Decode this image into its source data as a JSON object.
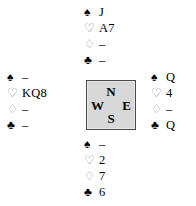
{
  "diagram": {
    "type": "bridge-hand-diagram",
    "suit_glyphs": {
      "spade": "♠",
      "heart": "♡",
      "diamond": "♢",
      "club": "♣"
    },
    "void_marker": "–",
    "compass": {
      "north": "N",
      "west": "W",
      "east": "E",
      "south": "S",
      "fill_color": "#d8d8d8",
      "border_color": "#4a4a4a"
    },
    "hands": {
      "north": {
        "label": "North",
        "rows": [
          {
            "suit": "spade",
            "cards": "J"
          },
          {
            "suit": "heart",
            "cards": "A7"
          },
          {
            "suit": "diamond",
            "cards": "–"
          },
          {
            "suit": "club",
            "cards": "–"
          }
        ]
      },
      "west": {
        "label": "West",
        "rows": [
          {
            "suit": "spade",
            "cards": "–"
          },
          {
            "suit": "heart",
            "cards": "KQ8"
          },
          {
            "suit": "diamond",
            "cards": "–"
          },
          {
            "suit": "club",
            "cards": "–"
          }
        ]
      },
      "east": {
        "label": "East",
        "rows": [
          {
            "suit": "spade",
            "cards": "Q"
          },
          {
            "suit": "heart",
            "cards": "4"
          },
          {
            "suit": "diamond",
            "cards": "–"
          },
          {
            "suit": "club",
            "cards": "Q"
          }
        ]
      },
      "south": {
        "label": "South",
        "rows": [
          {
            "suit": "spade",
            "cards": "–"
          },
          {
            "suit": "heart",
            "cards": "2"
          },
          {
            "suit": "diamond",
            "cards": "7"
          },
          {
            "suit": "club",
            "cards": "6"
          }
        ]
      }
    }
  }
}
